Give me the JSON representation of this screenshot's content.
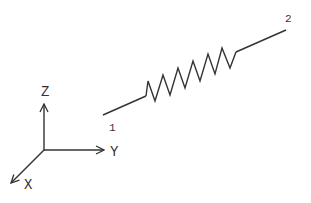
{
  "diagram": {
    "type": "spring-element",
    "axes": {
      "z_label": "Z",
      "y_label": "Y",
      "x_label": "X"
    },
    "nodes": [
      {
        "id": "1",
        "label": "1"
      },
      {
        "id": "2",
        "label": "2"
      }
    ],
    "element": {
      "kind": "spring",
      "coils": 6
    },
    "colors": {
      "stroke": "#333333",
      "background": "#ffffff"
    }
  }
}
